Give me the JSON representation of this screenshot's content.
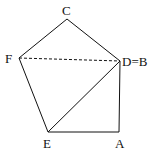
{
  "diagram": {
    "type": "geometry-pentagon-fold",
    "stroke_color": "#111111",
    "background": "#ffffff",
    "vertices": {
      "C": {
        "x": 67,
        "y": 19,
        "label": "C"
      },
      "F": {
        "x": 19,
        "y": 58,
        "label": "F"
      },
      "D": {
        "x": 120,
        "y": 61,
        "label": "D=B"
      },
      "E": {
        "x": 48,
        "y": 132,
        "label": "E"
      },
      "A": {
        "x": 119,
        "y": 132,
        "label": "A"
      }
    },
    "segments": [
      {
        "from": "C",
        "to": "F",
        "style": "solid"
      },
      {
        "from": "C",
        "to": "D",
        "style": "solid"
      },
      {
        "from": "F",
        "to": "E",
        "style": "solid"
      },
      {
        "from": "E",
        "to": "A",
        "style": "solid"
      },
      {
        "from": "A",
        "to": "D",
        "style": "solid"
      },
      {
        "from": "E",
        "to": "D",
        "style": "solid"
      },
      {
        "from": "F",
        "to": "D",
        "style": "dashed"
      }
    ]
  }
}
